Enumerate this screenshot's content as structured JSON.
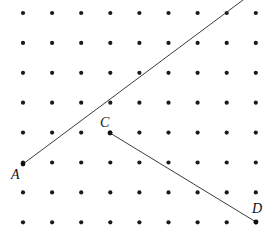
{
  "figure": {
    "type": "geometry-dot-grid",
    "width": 279,
    "height": 239,
    "background_color": "#ffffff",
    "grid": {
      "columns": 9,
      "rows": 8,
      "origin_x": 23,
      "origin_y": 13,
      "spacing_x": 29.1,
      "spacing_y": 29.9,
      "dot_radius": 2.1,
      "dot_color": "#1a1a1a"
    },
    "line_color": "#3c3c3c",
    "line_width": 1,
    "points": [
      {
        "id": "A",
        "label": "A",
        "col": 1,
        "row": 6,
        "x": 23,
        "y": 164,
        "label_x": 11,
        "label_y": 168,
        "marker": true
      },
      {
        "id": "C",
        "label": "C",
        "col": 4,
        "row": 5,
        "x": 110,
        "y": 133,
        "label_x": 100,
        "label_y": 116,
        "marker": true
      },
      {
        "id": "D",
        "label": "D",
        "col": 9,
        "row": 8,
        "x": 256,
        "y": 222,
        "label_x": 252,
        "label_y": 202,
        "marker": true
      }
    ],
    "segments": [
      {
        "name": "ray-A-through-grid",
        "from": {
          "x": 23,
          "y": 164
        },
        "to": {
          "x": 243,
          "y": 0
        },
        "description": "ray from A rising to the upper right, exiting the top edge"
      },
      {
        "name": "segment-C-D",
        "from": {
          "x": 110,
          "y": 133
        },
        "to": {
          "x": 256,
          "y": 222
        },
        "description": "segment from C descending to the right to D"
      }
    ]
  }
}
